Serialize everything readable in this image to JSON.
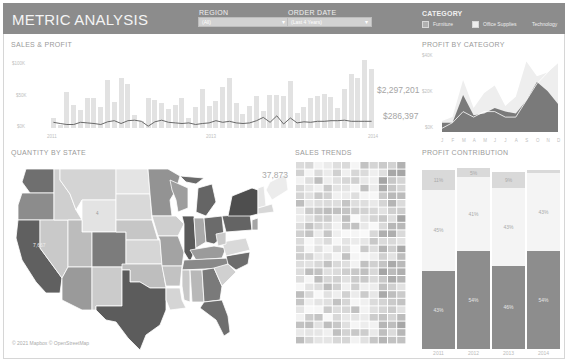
{
  "header": {
    "title": "METRIC ANALYSIS",
    "region": {
      "label": "REGION",
      "value": "(All)"
    },
    "order_date": {
      "label": "ORDER DATE",
      "value": "(Last 4 Years)"
    },
    "category": {
      "label": "CATEGORY",
      "options": [
        {
          "label": "Furniture",
          "checked": true,
          "color": "#b0b0b0"
        },
        {
          "label": "Office Supplies",
          "checked": true,
          "color": "#eeeeee"
        },
        {
          "label": "Technology",
          "checked": false,
          "color": "#8c8c8c"
        }
      ]
    }
  },
  "sales_profit": {
    "title": "SALES & PROFIT",
    "y_ticks": [
      "$100K",
      "$50K",
      "$0K"
    ],
    "x_ticks": [
      "2011",
      "2012",
      "2013",
      "2014"
    ],
    "total_sales": "$2,297,201",
    "total_profit": "$286,397"
  },
  "profit_by_category": {
    "title": "PROFIT BY CATEGORY",
    "y_ticks": [
      "$40K",
      "$20K",
      "$0K"
    ],
    "x_ticks": [
      "J",
      "F",
      "M",
      "A",
      "M",
      "J",
      "J",
      "A",
      "S",
      "O",
      "N",
      "D"
    ]
  },
  "quantity_by_state": {
    "title": "QUANTITY BY STATE",
    "max_value": "37,873",
    "min_value": "7,667",
    "wyoming_value": "4",
    "attribution": "© 2021 Mapbox © OpenStreetMap"
  },
  "sales_trends": {
    "title": "SALES TRENDS"
  },
  "profit_contribution": {
    "title": "PROFIT CONTRIBUTION",
    "years": [
      "2011",
      "2012",
      "2013",
      "2014"
    ]
  },
  "chart_data": [
    {
      "type": "bar",
      "title": "SALES & PROFIT",
      "x": [
        "2011-01",
        "2011-02",
        "2011-03",
        "2011-04",
        "2011-05",
        "2011-06",
        "2011-07",
        "2011-08",
        "2011-09",
        "2011-10",
        "2011-11",
        "2011-12",
        "2012-01",
        "2012-02",
        "2012-03",
        "2012-04",
        "2012-05",
        "2012-06",
        "2012-07",
        "2012-08",
        "2012-09",
        "2012-10",
        "2012-11",
        "2012-12",
        "2013-01",
        "2013-02",
        "2013-03",
        "2013-04",
        "2013-05",
        "2013-06",
        "2013-07",
        "2013-08",
        "2013-09",
        "2013-10",
        "2013-11",
        "2013-12",
        "2014-01",
        "2014-02",
        "2014-03",
        "2014-04",
        "2014-05",
        "2014-06",
        "2014-07",
        "2014-08",
        "2014-09",
        "2014-10",
        "2014-11",
        "2014-12"
      ],
      "series": [
        {
          "name": "Sales",
          "values": [
            14,
            4,
            52,
            34,
            26,
            43,
            44,
            31,
            70,
            37,
            72,
            64,
            19,
            10,
            44,
            40,
            36,
            28,
            34,
            43,
            14,
            31,
            56,
            32,
            39,
            60,
            73,
            36,
            20,
            32,
            47,
            25,
            48,
            48,
            47,
            68,
            22,
            30,
            43,
            47,
            50,
            45,
            29,
            57,
            78,
            72,
            98,
            85
          ]
        },
        {
          "name": "Profit",
          "values": [
            3,
            1,
            -1,
            -1,
            3,
            2,
            1,
            -1,
            4,
            6,
            1,
            6,
            7,
            5,
            -4,
            4,
            7,
            3,
            2,
            1,
            2,
            -1,
            1,
            2,
            6,
            3,
            5,
            2,
            1,
            2,
            6,
            12,
            3,
            15,
            0,
            11,
            2,
            4,
            3,
            5,
            5,
            6,
            6,
            7,
            5,
            5,
            5,
            5
          ]
        }
      ],
      "ylabel": "",
      "ylim": [
        -10,
        110
      ],
      "annotations": [
        "$2,297,201",
        "$286,397"
      ]
    },
    {
      "type": "area",
      "title": "PROFIT BY CATEGORY",
      "categories": [
        "J",
        "F",
        "M",
        "A",
        "M",
        "J",
        "J",
        "A",
        "S",
        "O",
        "N",
        "D"
      ],
      "series": [
        {
          "name": "Technology",
          "values": [
            5,
            5,
            20,
            9,
            10,
            13,
            11,
            10,
            17,
            27,
            22,
            15
          ]
        },
        {
          "name": "Office Supplies",
          "values": [
            6,
            8,
            28,
            13,
            21,
            25,
            14,
            19,
            38,
            30,
            32,
            37
          ]
        },
        {
          "name": "Furniture",
          "values": [
            0,
            1,
            3,
            2,
            3,
            3,
            2,
            2,
            5,
            8,
            10,
            12
          ]
        }
      ],
      "y_ticks": [
        "$40K",
        "$20K",
        "$0K"
      ],
      "ylim": [
        0,
        42
      ]
    },
    {
      "type": "bar",
      "title": "PROFIT CONTRIBUTION",
      "categories": [
        "2011",
        "2012",
        "2013",
        "2014"
      ],
      "series": [
        {
          "name": "Technology",
          "values": [
            43,
            54,
            46,
            54
          ]
        },
        {
          "name": "Office Supplies",
          "values": [
            45,
            41,
            43,
            43
          ]
        },
        {
          "name": "Furniture",
          "values": [
            11,
            5,
            9,
            2
          ]
        }
      ],
      "stacked": true,
      "labels": {
        "Technology": [
          "43%",
          "54%",
          "46%",
          "54%"
        ],
        "Office Supplies": [
          "45%",
          "41%",
          "43%",
          "43%"
        ],
        "Furniture": [
          "11%",
          "5%",
          "9%",
          ""
        ]
      }
    }
  ]
}
